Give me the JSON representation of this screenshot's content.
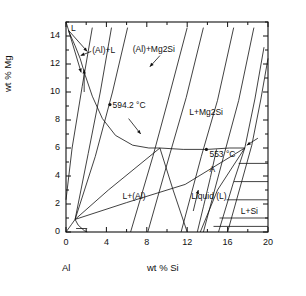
{
  "figure": {
    "kind": "phase-diagram",
    "axis_labels": {
      "x": "wt % Si",
      "y": "wt % Mg",
      "origin_corner": "Al"
    }
  },
  "chart_data": {
    "type": "line",
    "title": "",
    "subtitle": "",
    "xlabel": "wt % Si",
    "ylabel": "wt % Mg",
    "corner_label": "Al",
    "xlim": [
      0,
      20
    ],
    "ylim": [
      0,
      15
    ],
    "grid": false,
    "legend": "none",
    "xticks_major": [
      0,
      4,
      8,
      12,
      16,
      20
    ],
    "xticks_major_labels": [
      "0",
      "4",
      "8",
      "12",
      "16",
      "20"
    ],
    "xticks_minor": [
      2,
      6,
      10,
      14,
      18
    ],
    "yticks_major": [
      0,
      2,
      4,
      6,
      8,
      10,
      12,
      14
    ],
    "yticks_major_labels": [
      "0",
      "2",
      "4",
      "6",
      "8",
      "10",
      "12",
      "14"
    ],
    "yticks_minor": [
      1,
      3,
      5,
      7,
      9,
      11,
      13,
      15
    ],
    "annotations": [
      {
        "id": "liquid-L-top",
        "text": "L",
        "x": 0.5,
        "y": 14.6
      },
      {
        "id": "al-plus-L",
        "text": "(Al)+L",
        "x": 2.6,
        "y": 13.0
      },
      {
        "id": "al-plus-mg2si",
        "text": "(Al)+Mg2Si",
        "x": 6.6,
        "y": 13.1
      },
      {
        "id": "temp-594",
        "text": "594.2 °C",
        "x": 4.6,
        "y": 9.1
      },
      {
        "id": "L-plus-mg2si",
        "text": "L+Mg2Si",
        "x": 12.2,
        "y": 8.6
      },
      {
        "id": "temp-553",
        "text": "553 °C",
        "x": 14.2,
        "y": 5.6
      },
      {
        "id": "point-A",
        "text": "A",
        "x": 14.2,
        "y": 4.5
      },
      {
        "id": "L-plus-Al",
        "text": "L+(Al)",
        "x": 5.6,
        "y": 2.6
      },
      {
        "id": "liquid-L-center",
        "text": "Liquid (L)",
        "x": 12.4,
        "y": 2.6
      },
      {
        "id": "L-plus-Si",
        "text": "L+Si",
        "x": 17.3,
        "y": 1.5
      }
    ],
    "isotherm_labels": [
      "594.2 °C",
      "553 °C"
    ],
    "phase_fields": [
      "L",
      "(Al)+L",
      "(Al)+Mg2Si",
      "L+Mg2Si",
      "Liquid (L)",
      "L+(Al)",
      "L+Si",
      "A"
    ],
    "invariant_points": [
      {
        "name": "ternary-eutectic-ish",
        "x": 9.3,
        "y": 6.0
      },
      {
        "name": "node-right",
        "x": 17.7,
        "y": 6.0
      },
      {
        "name": "node-bottom",
        "x": 12.0,
        "y": 0.0
      },
      {
        "name": "node-origin",
        "x": 1.0,
        "y": 1.0
      }
    ],
    "series": [
      {
        "name": "liquidus-mg-rich",
        "points": [
          [
            0.0,
            15.0
          ],
          [
            0.35,
            14.2
          ],
          [
            0.9,
            13.3
          ],
          [
            1.4,
            12.4
          ],
          [
            1.9,
            11.2
          ],
          [
            2.6,
            9.7
          ],
          [
            3.6,
            8.1
          ],
          [
            4.9,
            6.9
          ],
          [
            6.6,
            6.2
          ],
          [
            8.2,
            6.0
          ],
          [
            9.3,
            6.0
          ]
        ]
      },
      {
        "name": "liquidus-to-553",
        "points": [
          [
            9.3,
            6.0
          ],
          [
            11.6,
            5.9
          ],
          [
            14.0,
            5.9
          ],
          [
            16.2,
            6.0
          ],
          [
            17.7,
            6.0
          ]
        ]
      },
      {
        "name": "solidus-left-1",
        "points": [
          [
            0.0,
            2.3
          ],
          [
            0.6,
            6.0
          ],
          [
            1.6,
            10.4
          ],
          [
            2.6,
            14.6
          ]
        ]
      },
      {
        "name": "solidus-left-2",
        "points": [
          [
            0.9,
            0.9
          ],
          [
            2.2,
            5.6
          ],
          [
            3.4,
            10.0
          ],
          [
            4.5,
            14.6
          ]
        ]
      },
      {
        "name": "solidus-left-3",
        "points": [
          [
            0.9,
            0.9
          ],
          [
            2.9,
            5.4
          ],
          [
            4.6,
            10.0
          ],
          [
            6.1,
            14.6
          ]
        ]
      },
      {
        "name": "mg2si-line-1",
        "points": [
          [
            6.4,
            0.0
          ],
          [
            8.6,
            5.4
          ],
          [
            10.1,
            9.4
          ],
          [
            12.0,
            14.6
          ]
        ]
      },
      {
        "name": "mg2si-line-2",
        "points": [
          [
            8.1,
            0.0
          ],
          [
            10.3,
            5.6
          ],
          [
            11.9,
            9.6
          ],
          [
            13.6,
            14.6
          ]
        ]
      },
      {
        "name": "mg2si-line-3",
        "points": [
          [
            11.4,
            0.0
          ],
          [
            13.4,
            5.4
          ],
          [
            15.0,
            9.4
          ],
          [
            16.6,
            14.6
          ]
        ]
      },
      {
        "name": "mg2si-line-4",
        "points": [
          [
            13.6,
            0.0
          ],
          [
            15.6,
            5.4
          ],
          [
            17.1,
            9.4
          ],
          [
            18.6,
            14.6
          ]
        ]
      },
      {
        "name": "si-boundary",
        "points": [
          [
            15.1,
            0.0
          ],
          [
            16.6,
            3.6
          ],
          [
            17.7,
            6.0
          ],
          [
            18.7,
            9.5
          ],
          [
            19.6,
            13.2
          ]
        ]
      },
      {
        "name": "si-boundary-2",
        "points": [
          [
            16.0,
            0.0
          ],
          [
            17.4,
            3.6
          ],
          [
            18.4,
            6.2
          ],
          [
            19.3,
            9.5
          ],
          [
            20.0,
            12.4
          ]
        ]
      },
      {
        "name": "eutectic-valley",
        "points": [
          [
            0.9,
            0.9
          ],
          [
            4.2,
            3.0
          ],
          [
            9.3,
            6.0
          ]
        ]
      },
      {
        "name": "eutectic-valley-2",
        "points": [
          [
            0.9,
            0.9
          ],
          [
            6.0,
            2.1
          ],
          [
            11.8,
            3.4
          ],
          [
            17.7,
            6.0
          ]
        ]
      },
      {
        "name": "al-boundary-low",
        "points": [
          [
            0.0,
            0.0
          ],
          [
            0.55,
            0.55
          ],
          [
            0.9,
            0.9
          ],
          [
            1.2,
            0.5
          ],
          [
            1.8,
            0.1
          ],
          [
            2.1,
            0.0
          ]
        ]
      },
      {
        "name": "tie-bottom",
        "points": [
          [
            1.0,
            0.25
          ],
          [
            2.1,
            0.25
          ]
        ]
      },
      {
        "name": "liquid-wedge-left",
        "points": [
          [
            9.3,
            6.0
          ],
          [
            10.6,
            3.0
          ],
          [
            12.0,
            0.0
          ]
        ]
      },
      {
        "name": "liquid-wedge-right",
        "points": [
          [
            17.7,
            6.0
          ],
          [
            15.0,
            3.0
          ],
          [
            13.3,
            0.0
          ]
        ]
      },
      {
        "name": "A-branch",
        "points": [
          [
            14.9,
            5.9
          ],
          [
            14.3,
            3.9
          ],
          [
            13.6,
            1.8
          ],
          [
            13.0,
            0.0
          ]
        ]
      },
      {
        "name": "tie-si-1",
        "points": [
          [
            16.6,
            3.6
          ],
          [
            20.0,
            3.6
          ]
        ]
      },
      {
        "name": "tie-si-2",
        "points": [
          [
            17.1,
            4.9
          ],
          [
            20.0,
            4.9
          ]
        ]
      },
      {
        "name": "tie-si-3",
        "points": [
          [
            15.9,
            2.3
          ],
          [
            20.0,
            2.3
          ]
        ]
      },
      {
        "name": "tie-si-4",
        "points": [
          [
            15.2,
            1.0
          ],
          [
            20.0,
            1.0
          ]
        ]
      },
      {
        "name": "tie-si-5",
        "points": [
          [
            14.6,
            0.4
          ],
          [
            20.0,
            0.4
          ]
        ]
      }
    ],
    "arrows": [
      {
        "id": "arrow-top-left-a",
        "from": [
          0.25,
          14.4
        ],
        "to": [
          2.1,
          12.9
        ]
      },
      {
        "id": "arrow-top-left-b",
        "from": [
          0.25,
          14.4
        ],
        "to": [
          1.5,
          11.4
        ]
      },
      {
        "id": "arrow-alL",
        "from": [
          2.5,
          12.9
        ],
        "to": [
          1.45,
          12.6
        ]
      },
      {
        "id": "arrow-up-left",
        "from": [
          1.8,
          10.0
        ],
        "to": [
          1.8,
          11.6
        ]
      },
      {
        "id": "arrow-mg2si",
        "from": [
          9.3,
          12.6
        ],
        "to": [
          8.3,
          11.8
        ]
      },
      {
        "id": "arrow-mid-down",
        "from": [
          6.2,
          8.1
        ],
        "to": [
          7.4,
          7.0
        ]
      },
      {
        "id": "arrow-right-node",
        "from": [
          19.0,
          6.7
        ],
        "to": [
          17.9,
          6.2
        ]
      },
      {
        "id": "arrow-liquid-up",
        "from": [
          12.6,
          1.5
        ],
        "to": [
          13.1,
          3.0
        ]
      }
    ]
  }
}
